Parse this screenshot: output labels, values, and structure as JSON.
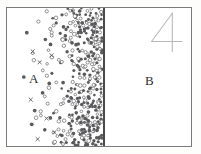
{
  "figure": {
    "number_label": "4",
    "caption_visible": false
  },
  "regions": [
    {
      "id": "a",
      "label": "A",
      "description": "left compartment, densely populated with particles concentrated against the barrier",
      "particle_density": "high"
    },
    {
      "id": "b",
      "label": "B",
      "description": "right compartment, empty of particles",
      "particle_density": "none"
    }
  ],
  "barrier": {
    "name": "membrane",
    "orientation": "vertical",
    "color": "#4a4a4c"
  },
  "colors": {
    "frame_border": "#7b7b7d",
    "background": "#ffffff",
    "page_background": "#fdfdfc",
    "particle_fill": "#5a5a5c",
    "particle_outline": "#6e6e70",
    "label_text": "#2e2e30",
    "figure_number": "#b4b4b6"
  },
  "chart_data": {
    "type": "scatter",
    "title": "",
    "xlabel": "",
    "ylabel": "",
    "xlim": [
      0,
      186
    ],
    "ylim": [
      0,
      140
    ],
    "grid": false,
    "legend": "none",
    "annotations": [
      {
        "text": "A",
        "x": 22,
        "y": 70
      },
      {
        "text": "B",
        "x": 140,
        "y": 72
      },
      {
        "text": "4",
        "x": 166,
        "y": 20
      }
    ],
    "series": [
      {
        "name": "particles-region-a",
        "marker": "circle",
        "note": "concentration gradient increasing toward x=96 (barrier); region B (x>98) contains zero particles"
      }
    ],
    "density_profile": {
      "x_bins": [
        0,
        10,
        20,
        30,
        40,
        50,
        60,
        70,
        80,
        90,
        96
      ],
      "relative_counts": [
        0,
        1,
        3,
        8,
        20,
        45,
        80,
        120,
        150,
        165,
        170
      ]
    }
  }
}
